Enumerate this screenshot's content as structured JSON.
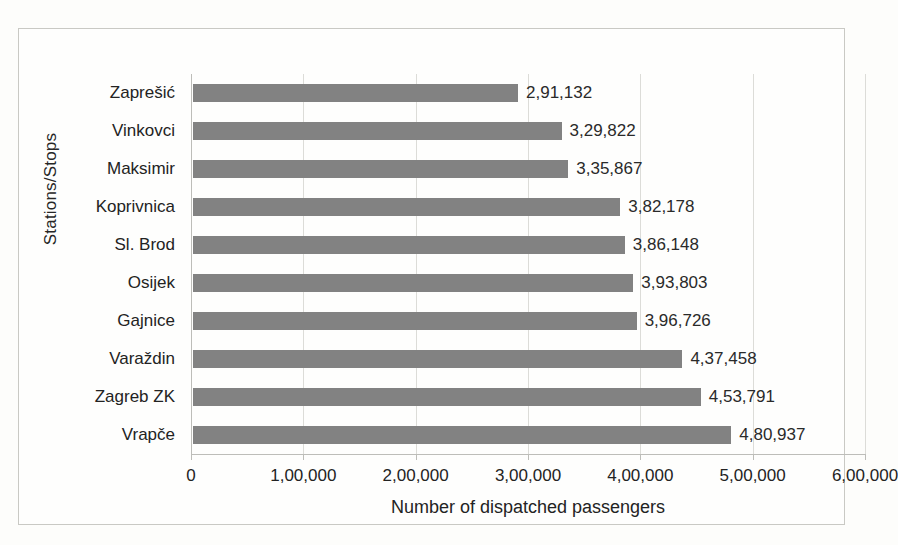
{
  "chart_data": {
    "type": "bar",
    "orientation": "horizontal",
    "title": "",
    "xlabel": "Number of dispatched passengers",
    "ylabel": "Stations/Stops",
    "categories": [
      "Zaprešić",
      "Vinkovci",
      "Maksimir",
      "Koprivnica",
      "Sl. Brod",
      "Osijek",
      "Gajnice",
      "Varaždin",
      "Zagreb ZK",
      "Vrapče"
    ],
    "values": [
      291132,
      329822,
      335867,
      382178,
      386148,
      393803,
      396726,
      437458,
      453791,
      480937
    ],
    "data_labels": [
      "2,91,132",
      "3,29,822",
      "3,35,867",
      "3,82,178",
      "3,86,148",
      "3,93,803",
      "3,96,726",
      "4,37,458",
      "4,53,791",
      "4,80,937"
    ],
    "xlim": [
      0,
      600000
    ],
    "xticks": [
      0,
      100000,
      200000,
      300000,
      400000,
      500000,
      600000
    ],
    "xtick_labels": [
      "0",
      "1,00,000",
      "2,00,000",
      "3,00,000",
      "4,00,000",
      "5,00,000",
      "6,00,000"
    ],
    "grid": "vertical",
    "legend": "none",
    "bar_color": "#828282",
    "number_format": "indian-grouping"
  }
}
